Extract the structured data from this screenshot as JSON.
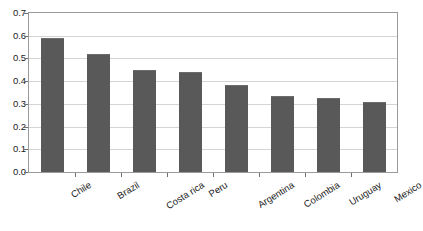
{
  "chart_data": {
    "type": "bar",
    "title": "",
    "subtitle": "",
    "xlabel": "",
    "ylabel": "",
    "categories": [
      "Chile",
      "Brazil",
      "Costa rica",
      "Peru",
      "Argentina",
      "Colombia",
      "Uruguay",
      "Mexico"
    ],
    "values": [
      0.59,
      0.52,
      0.45,
      0.44,
      0.385,
      0.335,
      0.325,
      0.31
    ],
    "series": [
      {
        "name": "",
        "values": [
          0.59,
          0.52,
          0.45,
          0.44,
          0.385,
          0.335,
          0.325,
          0.31
        ]
      }
    ],
    "ylim": [
      0.0,
      0.7
    ],
    "ytick_labels": [
      "0.0",
      "0.1",
      "0.2",
      "0.3",
      "0.4",
      "0.5",
      "0.6",
      "0.7"
    ],
    "ytick_values": [
      0.0,
      0.1,
      0.2,
      0.3,
      0.4,
      0.5,
      0.6,
      0.7
    ],
    "grid": true,
    "grid_axis": "y",
    "legend": false,
    "legend_position": "none",
    "bar_color": "#595959",
    "gridline_color": "#d4d4d4",
    "axis_color": "#9a9a9a",
    "text_color": "#1c1c1c",
    "background_color": "#ffffff",
    "label_rotation_degrees": -32
  }
}
